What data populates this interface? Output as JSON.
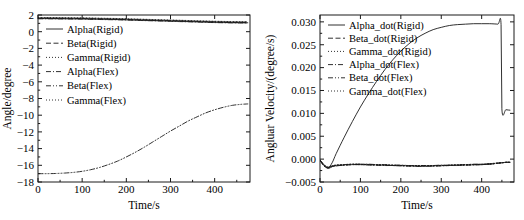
{
  "figure": {
    "background": "#ffffff",
    "ink": "#1a1a1a",
    "panels": [
      "left",
      "right"
    ]
  },
  "chart_data": [
    {
      "type": "line",
      "panel": "left",
      "title": "",
      "xlabel": "Time/s",
      "ylabel": "Angle/degree",
      "xlim": [
        0,
        480
      ],
      "ylim": [
        -18,
        2
      ],
      "xticks": [
        0,
        100,
        200,
        300,
        400
      ],
      "yticks": [
        2,
        0,
        -2,
        -4,
        -6,
        -8,
        -10,
        -12,
        -14,
        -16,
        -18
      ],
      "xtick_labels": [
        "0",
        "100",
        "200",
        "300",
        "400"
      ],
      "ytick_labels": [
        "2",
        "0",
        "−2",
        "−4",
        "−6",
        "−8",
        "−10",
        "−12",
        "−14",
        "−16",
        "−18"
      ],
      "grid": false,
      "legend_position": "upper-left-inside",
      "x": [
        0,
        20,
        40,
        60,
        80,
        100,
        120,
        140,
        160,
        180,
        200,
        220,
        240,
        260,
        280,
        300,
        320,
        340,
        360,
        380,
        400,
        420,
        440,
        460,
        475
      ],
      "series": [
        {
          "name": "Alpha(Rigid)",
          "style": "solid",
          "values": [
            1.58,
            1.58,
            1.57,
            1.56,
            1.55,
            1.54,
            1.52,
            1.5,
            1.48,
            1.46,
            1.43,
            1.4,
            1.37,
            1.34,
            1.31,
            1.28,
            1.25,
            1.22,
            1.19,
            1.16,
            1.13,
            1.11,
            1.09,
            1.08,
            1.07
          ]
        },
        {
          "name": "Beta(Rigid)",
          "style": "dashed",
          "values": [
            1.62,
            1.62,
            1.61,
            1.6,
            1.59,
            1.58,
            1.56,
            1.54,
            1.52,
            1.5,
            1.47,
            1.44,
            1.41,
            1.38,
            1.35,
            1.32,
            1.29,
            1.26,
            1.23,
            1.2,
            1.17,
            1.15,
            1.13,
            1.12,
            1.11
          ]
        },
        {
          "name": "Gamma(Rigid)",
          "style": "dotted",
          "values": [
            1.66,
            1.66,
            1.65,
            1.64,
            1.63,
            1.62,
            1.6,
            1.58,
            1.56,
            1.54,
            1.51,
            1.48,
            1.45,
            1.42,
            1.39,
            1.36,
            1.33,
            1.3,
            1.27,
            1.24,
            1.21,
            1.19,
            1.17,
            1.16,
            1.15
          ]
        },
        {
          "name": "Alpha(Flex)",
          "style": "dashdot",
          "values": [
            1.54,
            1.54,
            1.53,
            1.52,
            1.51,
            1.5,
            1.48,
            1.46,
            1.44,
            1.42,
            1.39,
            1.36,
            1.33,
            1.3,
            1.27,
            1.24,
            1.21,
            1.18,
            1.15,
            1.12,
            1.09,
            1.07,
            1.05,
            1.04,
            1.03
          ]
        },
        {
          "name": "Beta(Flex)",
          "style": "dashdotdot",
          "values": [
            -17.0,
            -17.0,
            -16.98,
            -16.93,
            -16.85,
            -16.72,
            -16.52,
            -16.25,
            -15.9,
            -15.5,
            -15.0,
            -14.45,
            -13.85,
            -13.2,
            -12.55,
            -11.9,
            -11.3,
            -10.7,
            -10.2,
            -9.72,
            -9.35,
            -9.05,
            -8.82,
            -8.7,
            -8.65
          ]
        },
        {
          "name": "Gamma(Flex)",
          "style": "dotted",
          "values": [
            1.7,
            1.7,
            1.69,
            1.68,
            1.67,
            1.66,
            1.64,
            1.62,
            1.6,
            1.58,
            1.55,
            1.52,
            1.49,
            1.46,
            1.43,
            1.4,
            1.37,
            1.34,
            1.31,
            1.28,
            1.25,
            1.23,
            1.21,
            1.2,
            1.19
          ]
        }
      ]
    },
    {
      "type": "line",
      "panel": "right",
      "title": "",
      "xlabel": "Time/s",
      "ylabel": "Angluar Velocity/(degree/s)",
      "xlim": [
        0,
        480
      ],
      "ylim": [
        -0.005,
        0.0315
      ],
      "xticks": [
        0,
        100,
        200,
        300,
        400
      ],
      "yticks": [
        0.03,
        0.025,
        0.02,
        0.015,
        0.01,
        0.005,
        0.0,
        -0.005
      ],
      "xtick_labels": [
        "0",
        "100",
        "200",
        "300",
        "400"
      ],
      "ytick_labels": [
        "0.030",
        "0.025",
        "0.020",
        "0.015",
        "0.010",
        "0.005",
        "0.000",
        "−0.005"
      ],
      "grid": false,
      "legend_position": "upper-left-inside",
      "x": [
        0,
        10,
        20,
        30,
        40,
        60,
        80,
        100,
        120,
        140,
        160,
        180,
        200,
        220,
        240,
        260,
        280,
        300,
        320,
        340,
        360,
        380,
        400,
        420,
        440,
        448,
        450,
        460,
        470
      ],
      "series": [
        {
          "name": "Alpha_dot(Rigid)",
          "style": "solid",
          "values": [
            -0.0002,
            -0.0014,
            -0.0019,
            -0.0008,
            0.0012,
            0.0048,
            0.0082,
            0.0114,
            0.0143,
            0.017,
            0.0195,
            0.0217,
            0.0236,
            0.0252,
            0.0265,
            0.0275,
            0.0283,
            0.0288,
            0.0292,
            0.0294,
            0.0295,
            0.0296,
            0.0296,
            0.0296,
            0.0295,
            0.0294,
            0.011,
            0.0108,
            0.0107
          ]
        },
        {
          "name": "Beta_dot(Rigid)",
          "style": "dashed",
          "values": [
            -0.0002,
            -0.0014,
            -0.0019,
            -0.0016,
            -0.0014,
            -0.0013,
            -0.0012,
            -0.0012,
            -0.0012,
            -0.0013,
            -0.0013,
            -0.0014,
            -0.0014,
            -0.0015,
            -0.0015,
            -0.0015,
            -0.0015,
            -0.0014,
            -0.0014,
            -0.0013,
            -0.0013,
            -0.0012,
            -0.0012,
            -0.0011,
            -0.0009,
            -0.0008,
            -0.0008,
            -0.0007,
            -0.0007
          ]
        },
        {
          "name": "Gamma_dot(Rigid)",
          "style": "dotted",
          "values": [
            -0.0002,
            -0.0013,
            -0.0018,
            -0.0015,
            -0.0013,
            -0.0012,
            -0.0011,
            -0.0011,
            -0.0012,
            -0.0012,
            -0.0013,
            -0.0013,
            -0.0014,
            -0.0014,
            -0.0014,
            -0.0014,
            -0.0014,
            -0.0014,
            -0.0013,
            -0.0013,
            -0.0012,
            -0.0012,
            -0.0011,
            -0.001,
            -0.0009,
            -0.0008,
            -0.0008,
            -0.0007,
            -0.0007
          ]
        },
        {
          "name": "Alpha_dot(Flex)",
          "style": "dashdot",
          "values": [
            -0.0003,
            -0.0015,
            -0.002,
            -0.0017,
            -0.0015,
            -0.0013,
            -0.0012,
            -0.0012,
            -0.0013,
            -0.0013,
            -0.0014,
            -0.0014,
            -0.0015,
            -0.0015,
            -0.0016,
            -0.0016,
            -0.0015,
            -0.0015,
            -0.0014,
            -0.0014,
            -0.0013,
            -0.0013,
            -0.0012,
            -0.0011,
            -0.0009,
            -0.0008,
            -0.0008,
            -0.0007,
            -0.0007
          ]
        },
        {
          "name": "Beta_dot(Flex)",
          "style": "dashdotdot",
          "values": [
            -0.0002,
            -0.0012,
            -0.0017,
            -0.0015,
            -0.0013,
            -0.0012,
            -0.0011,
            -0.0011,
            -0.0011,
            -0.0012,
            -0.0012,
            -0.0013,
            -0.0013,
            -0.0014,
            -0.0014,
            -0.0014,
            -0.0014,
            -0.0013,
            -0.0013,
            -0.0012,
            -0.0012,
            -0.0011,
            -0.0011,
            -0.001,
            -0.0008,
            -0.0008,
            -0.0008,
            -0.0007,
            -0.0007
          ]
        },
        {
          "name": "Gamma_dot(Flex)",
          "style": "dotted",
          "values": [
            -0.0003,
            -0.0014,
            -0.0019,
            -0.0016,
            -0.0014,
            -0.0013,
            -0.0012,
            -0.0012,
            -0.0012,
            -0.0013,
            -0.0013,
            -0.0014,
            -0.0014,
            -0.0015,
            -0.0015,
            -0.0015,
            -0.0015,
            -0.0014,
            -0.0014,
            -0.0013,
            -0.0013,
            -0.0012,
            -0.0012,
            -0.0011,
            -0.0009,
            -0.0008,
            -0.0008,
            -0.0007,
            -0.0007
          ]
        }
      ]
    }
  ]
}
